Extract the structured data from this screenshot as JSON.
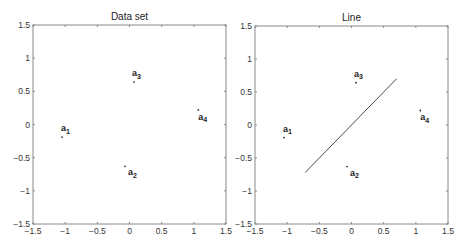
{
  "chart_data": [
    {
      "type": "scatter",
      "title": "Data set",
      "xlabel": "",
      "ylabel": "",
      "xlim": [
        -1.5,
        1.5
      ],
      "ylim": [
        -1.5,
        1.5
      ],
      "xticks": [
        "-1.5",
        "-1",
        "-0.5",
        "0",
        "0.5",
        "1",
        "1.5"
      ],
      "yticks": [
        "1.5",
        "1",
        "0.5",
        "0",
        "-0.5",
        "-1",
        "-1.5"
      ],
      "grid": false,
      "points": [
        {
          "label": "a",
          "sub": "1",
          "x": -1.05,
          "y": -0.19
        },
        {
          "label": "a",
          "sub": "2",
          "x": -0.07,
          "y": -0.63
        },
        {
          "label": "a",
          "sub": "3",
          "x": 0.07,
          "y": 0.64
        },
        {
          "label": "a",
          "sub": "4",
          "x": 1.07,
          "y": 0.22
        }
      ]
    },
    {
      "type": "scatter",
      "title": "Line",
      "xlabel": "",
      "ylabel": "",
      "xlim": [
        -1.5,
        1.5
      ],
      "ylim": [
        -1.5,
        1.5
      ],
      "xticks": [
        "-1.5",
        "-1",
        "-0.5",
        "0",
        "0.5",
        "1",
        "1.5"
      ],
      "yticks": [
        "1.5",
        "1",
        "0.5",
        "0",
        "-0.5",
        "-1",
        "-1.5"
      ],
      "grid": false,
      "points": [
        {
          "label": "a",
          "sub": "1",
          "x": -1.05,
          "y": -0.19
        },
        {
          "label": "a",
          "sub": "2",
          "x": -0.07,
          "y": -0.63
        },
        {
          "label": "a",
          "sub": "3",
          "x": 0.07,
          "y": 0.64
        },
        {
          "label": "a",
          "sub": "4",
          "x": 1.07,
          "y": 0.22
        }
      ],
      "line": {
        "x": [
          -0.72,
          0.7
        ],
        "y": [
          -0.72,
          0.7
        ]
      }
    }
  ]
}
